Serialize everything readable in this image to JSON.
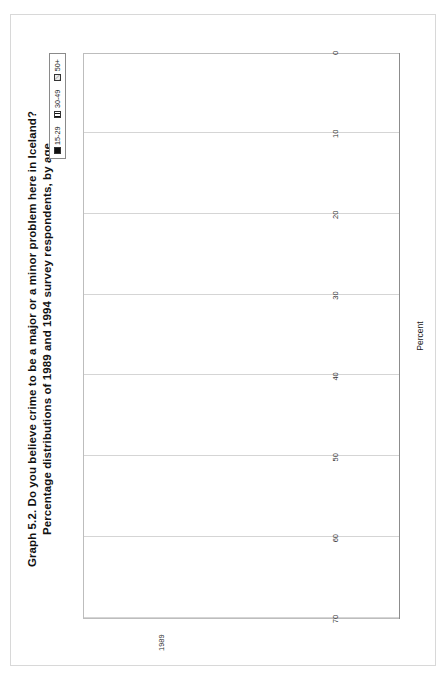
{
  "figure": {
    "title_line1": "Graph 5.2.  Do you believe crime to be a major or a minor problem here in Iceland?",
    "title_line2": "Percentage distributions of 1989 and 1994 survey respondents, by age"
  },
  "legend": {
    "title": "Age",
    "items": [
      {
        "label": "15-29",
        "fill": "solid"
      },
      {
        "label": "30-49",
        "fill": "vertical-stripe"
      },
      {
        "label": "50+",
        "fill": "diagonal-stripe"
      }
    ]
  },
  "axis": {
    "ylabel": "Percent",
    "ticks": [
      "70",
      "60",
      "50",
      "40",
      "30",
      "20",
      "10",
      "0"
    ],
    "ymin": 0,
    "ymax": 70
  },
  "panels": [
    {
      "year": "1989"
    },
    {
      "year": "1994"
    }
  ],
  "categories": [
    "Great problem",
    "Somewhat great",
    "Not too great",
    "Very minor"
  ],
  "chart_data": {
    "type": "bar",
    "title": "Graph 5.2.  Do you believe crime to be a major or a minor problem here in Iceland? Percentage distributions of 1989 and 1994 survey respondents, by age",
    "xlabel": "",
    "ylabel": "Percent",
    "ylim": [
      0,
      70
    ],
    "grid": true,
    "legend_position": "top-right",
    "orientation": "vertical-columns-drawn-rotated",
    "panels": [
      {
        "name": "1989",
        "categories": [
          "Great problem",
          "Somewhat great",
          "Not too great",
          "Very minor"
        ],
        "series": [
          {
            "name": "15-29",
            "values": [
              2,
              50,
              42,
              2
            ]
          },
          {
            "name": "30-49",
            "values": [
              9,
              53,
              41,
              1
            ]
          },
          {
            "name": "50+",
            "values": [
              23,
              67,
              30,
              0
            ]
          }
        ]
      },
      {
        "name": "1994",
        "categories": [
          "Great problem",
          "Somewhat great",
          "Not too great",
          "Very minor"
        ],
        "series": [
          {
            "name": "15-29",
            "values": [
              21,
              61,
              17,
              1
            ]
          },
          {
            "name": "30-49",
            "values": [
              31,
              56,
              12,
              0
            ]
          },
          {
            "name": "50+",
            "values": [
              45,
              51,
              4,
              0
            ]
          }
        ]
      }
    ]
  }
}
